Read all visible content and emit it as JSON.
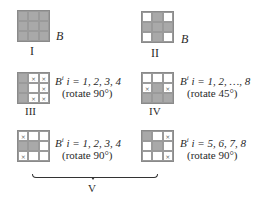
{
  "colors": {
    "filled": "#a9a9a9",
    "empty": "#ffffff",
    "grid_line": "#9a9a9a",
    "text": "#2a2a2a"
  },
  "panels": [
    {
      "id": "I",
      "label": "I",
      "set_label": "B",
      "cells": [
        "g",
        "g",
        "g",
        "g",
        "g",
        "g",
        "g",
        "g",
        "g"
      ],
      "marks": [
        "",
        "",
        "",
        "",
        "",
        "",
        "",
        "",
        ""
      ]
    },
    {
      "id": "II",
      "label": "II",
      "set_label": "B",
      "cells": [
        "w",
        "g",
        "w",
        "g",
        "g",
        "g",
        "w",
        "g",
        "w"
      ],
      "marks": [
        "",
        "",
        "",
        "",
        "",
        "",
        "",
        "",
        ""
      ]
    },
    {
      "id": "III",
      "label": "III",
      "equation": {
        "base": "B",
        "sup": "i",
        "rest": " i = 1, 2, 3, 4"
      },
      "note": "(rotate 90°)",
      "cells": [
        "g",
        "w",
        "w",
        "g",
        "w",
        "w",
        "g",
        "w",
        "w"
      ],
      "marks": [
        "",
        "×",
        "×",
        "",
        "",
        "×",
        "",
        "×",
        "×"
      ]
    },
    {
      "id": "IV",
      "label": "IV",
      "equation": {
        "base": "B",
        "sup": "i",
        "rest": " i = 1, 2, …, 8"
      },
      "note": "(rotate 45°)",
      "cells": [
        "w",
        "w",
        "w",
        "w",
        "g",
        "w",
        "g",
        "g",
        "g"
      ],
      "marks": [
        "",
        "",
        "",
        "×",
        "",
        "×",
        "",
        "",
        ""
      ]
    },
    {
      "id": "V-a",
      "equation": {
        "base": "B",
        "sup": "i",
        "rest": " i = 1, 2, 3, 4"
      },
      "note": "(rotate 90°)",
      "cells": [
        "w",
        "w",
        "w",
        "g",
        "g",
        "w",
        "w",
        "w",
        "w"
      ],
      "marks": [
        "×",
        "",
        "",
        "",
        "",
        "",
        "×",
        "",
        ""
      ]
    },
    {
      "id": "V-b",
      "equation": {
        "base": "B",
        "sup": "i",
        "rest": " i = 5, 6, 7, 8"
      },
      "note": "(rotate 90°)",
      "cells": [
        "g",
        "w",
        "w",
        "w",
        "g",
        "w",
        "w",
        "w",
        "w"
      ],
      "marks": [
        "",
        "",
        "×",
        "",
        "",
        "",
        "",
        "",
        "×"
      ]
    }
  ],
  "group": {
    "label": "V"
  }
}
